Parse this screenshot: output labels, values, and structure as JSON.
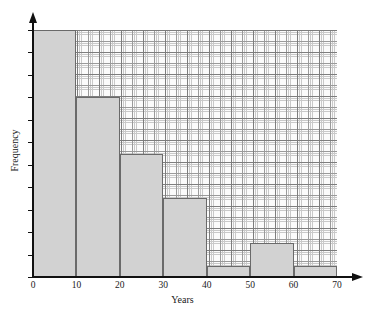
{
  "chart_data": {
    "type": "bar",
    "title": "",
    "subtitle": "",
    "xlabel": "Years",
    "ylabel": "Frequency",
    "xlim": [
      0,
      70
    ],
    "ylim": [
      0,
      22
    ],
    "grid": true,
    "legend": null,
    "bin_width": 10,
    "categories": [
      "0-10",
      "10-20",
      "20-30",
      "30-40",
      "40-50",
      "50-60",
      "60-70"
    ],
    "bin_edges": [
      0,
      10,
      20,
      30,
      40,
      50,
      60,
      70
    ],
    "values": [
      22,
      16,
      11,
      7,
      1,
      3,
      1
    ],
    "x_ticks": [
      0,
      10,
      20,
      30,
      40,
      50,
      60,
      70
    ],
    "x_tick_labels": [
      "0",
      "10",
      "20",
      "30",
      "40",
      "50",
      "60",
      "70"
    ],
    "y_ticks": [
      0,
      2,
      4,
      6,
      8,
      10,
      12,
      14,
      16,
      18,
      20,
      22
    ],
    "y_tick_labels": [
      "0",
      "2",
      "4",
      "6",
      "8",
      "10",
      "12",
      "14",
      "16",
      "18",
      "20",
      "22"
    ],
    "bar_fill_color": "#d2d2d2",
    "bar_edge_color": "#6a6a6a",
    "axis_color": "#111111",
    "grid_color": "#9a9a9a",
    "background_color": "#ffffff"
  }
}
